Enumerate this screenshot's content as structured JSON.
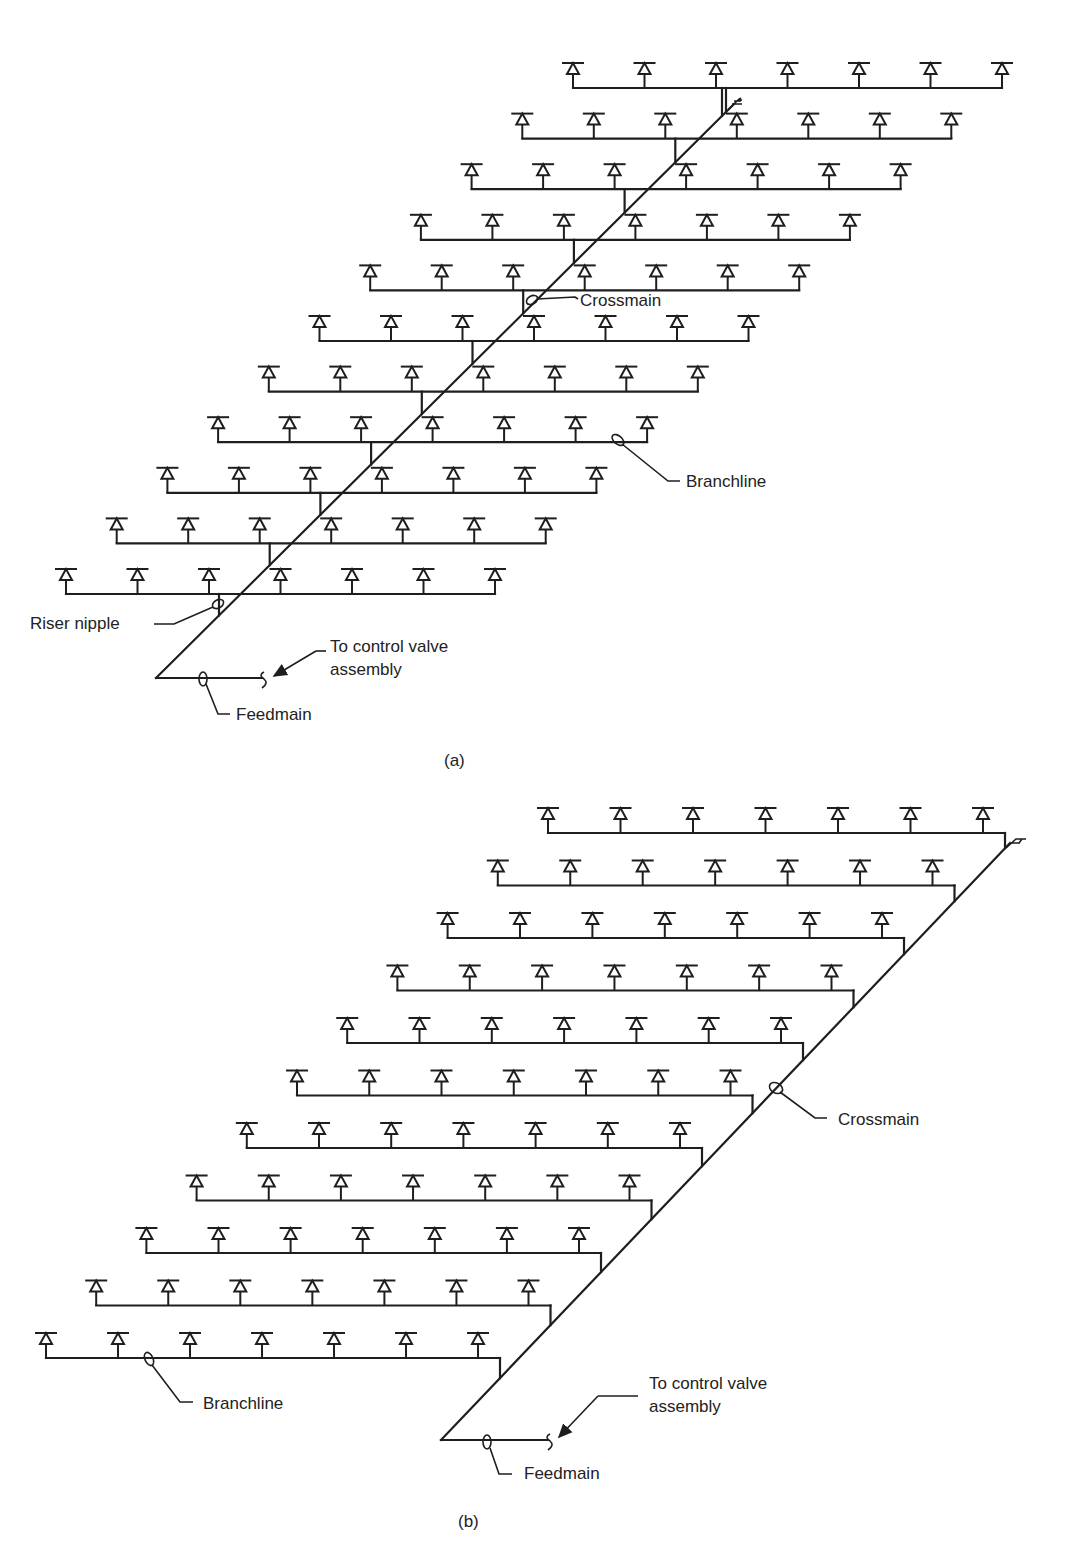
{
  "figure": {
    "panels": [
      {
        "id": "a",
        "caption": "(a)",
        "description": "Center-central feed: crossmain runs diagonally through the middle of branchlines; riser nipples connect each branchline to crossmain",
        "rows": 11,
        "heads_per_row": 7,
        "labels": {
          "crossmain": "Crossmain",
          "branchline": "Branchline",
          "riser_nipple": "Riser nipple",
          "control_valve": "To control valve assembly",
          "control_valve_line1": "To control valve",
          "control_valve_line2": "assembly",
          "feedmain": "Feedmain"
        }
      },
      {
        "id": "b",
        "caption": "(b)",
        "description": "End-side feed: branchlines connect at their right ends down to the diagonal crossmain",
        "rows": 11,
        "heads_per_row": 7,
        "labels": {
          "crossmain": "Crossmain",
          "branchline": "Branchline",
          "control_valve": "To control valve assembly",
          "control_valve_line1": "To control valve",
          "control_valve_line2": "assembly",
          "feedmain": "Feedmain"
        }
      }
    ],
    "colors": {
      "line": "#1e1e1e",
      "text": "#222222",
      "background": "#ffffff"
    }
  }
}
